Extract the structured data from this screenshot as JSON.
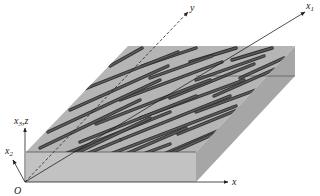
{
  "diagram": {
    "type": "composite-fiber-block",
    "colors": {
      "top_face": "#b5b5b5",
      "front_face": "#c2c2c2",
      "right_face": "#a6a6a6",
      "fiber": "#5a5a5a",
      "fiber_edge": "#2e2e2e",
      "axis": "#222222"
    },
    "box": {
      "front_left_top": [
        26,
        152
      ],
      "front_right_top": [
        196,
        152
      ],
      "back_right_top": [
        295,
        46
      ],
      "back_left_top": [
        128,
        46
      ],
      "front_left_bottom": [
        26,
        182
      ],
      "front_right_bottom": [
        196,
        182
      ],
      "back_right_bottom": [
        295,
        76
      ]
    },
    "origin": {
      "label": "O",
      "point": [
        25,
        182
      ],
      "label_pos": [
        14,
        194
      ]
    },
    "axes": [
      {
        "name": "x",
        "label": "x",
        "sub": "",
        "from": [
          25,
          182
        ],
        "to": [
          228,
          182
        ],
        "label_pos": [
          232,
          185
        ],
        "dashed": false
      },
      {
        "name": "x3z",
        "label": "x",
        "sub": "3",
        "suffix": ",z",
        "from": [
          25,
          182
        ],
        "to": [
          25,
          128
        ],
        "label_pos": [
          14,
          124
        ],
        "dashed": false
      },
      {
        "name": "x2",
        "label": "x",
        "sub": "2",
        "suffix": "",
        "from": [
          25,
          182
        ],
        "to": [
          13,
          160
        ],
        "label_pos": [
          5,
          154
        ],
        "dashed": false
      },
      {
        "name": "x1",
        "label": "x",
        "sub": "1",
        "suffix": "",
        "from": [
          25,
          182
        ],
        "to": [
          305,
          12
        ],
        "label_pos": [
          306,
          9
        ],
        "dashed": false
      },
      {
        "name": "y",
        "label": "y",
        "sub": "",
        "suffix": "",
        "from": [
          25,
          182
        ],
        "to": [
          188,
          12
        ],
        "label_pos": [
          190,
          11
        ],
        "dashed": true
      }
    ],
    "fibers": [
      [
        110,
        66,
        142,
        48
      ],
      [
        142,
        66,
        196,
        48
      ],
      [
        190,
        62,
        236,
        48
      ],
      [
        232,
        60,
        272,
        48
      ],
      [
        82,
        90,
        178,
        52
      ],
      [
        150,
        78,
        212,
        56
      ],
      [
        196,
        80,
        264,
        56
      ],
      [
        240,
        78,
        284,
        58
      ],
      [
        70,
        110,
        168,
        66
      ],
      [
        120,
        100,
        222,
        62
      ],
      [
        170,
        98,
        254,
        64
      ],
      [
        214,
        96,
        282,
        66
      ],
      [
        48,
        132,
        160,
        80
      ],
      [
        96,
        124,
        210,
        80
      ],
      [
        140,
        118,
        244,
        80
      ],
      [
        196,
        112,
        272,
        84
      ],
      [
        40,
        148,
        140,
        100
      ],
      [
        80,
        142,
        196,
        96
      ],
      [
        120,
        140,
        230,
        96
      ],
      [
        178,
        134,
        262,
        100
      ],
      [
        60,
        156,
        170,
        112
      ],
      [
        100,
        158,
        236,
        106
      ],
      [
        150,
        160,
        248,
        118
      ],
      [
        210,
        148,
        264,
        120
      ],
      [
        28,
        176,
        150,
        118
      ],
      [
        70,
        178,
        186,
        128
      ],
      [
        110,
        180,
        214,
        134
      ],
      [
        154,
        180,
        220,
        146
      ],
      [
        48,
        170,
        120,
        140
      ],
      [
        90,
        174,
        170,
        144
      ],
      [
        140,
        178,
        194,
        154
      ],
      [
        176,
        180,
        196,
        170
      ]
    ]
  }
}
